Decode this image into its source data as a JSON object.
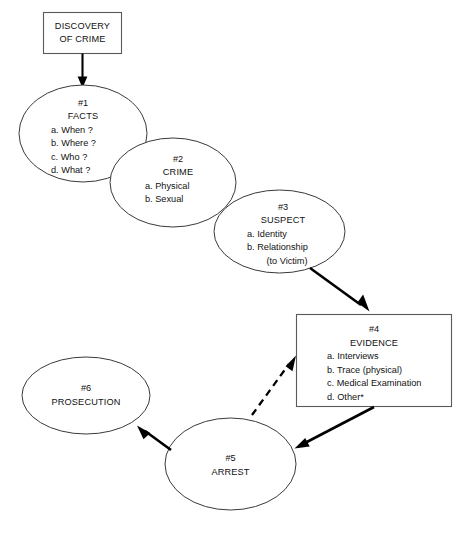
{
  "diagram": {
    "background_color": "#ffffff",
    "line_color": "#3a3a3a",
    "arrow_color": "#000000",
    "text_color": "#111111",
    "start": {
      "id": "discovery-of-crime",
      "shape": "rectangle",
      "line1": "DISCOVERY",
      "line2": "OF CRIME"
    },
    "nodes": [
      {
        "id": "facts",
        "shape": "ellipse",
        "number": "#1",
        "title": "FACTS",
        "items": [
          "a. When ?",
          "b. Where ?",
          "c. Who ?",
          "d. What ?"
        ]
      },
      {
        "id": "crime",
        "shape": "ellipse",
        "number": "#2",
        "title": "CRIME",
        "items": [
          "a. Physical",
          "b. Sexual"
        ]
      },
      {
        "id": "suspect",
        "shape": "ellipse",
        "number": "#3",
        "title": "SUSPECT",
        "items": [
          "a. Identity",
          "b. Relationship",
          "(to Victim)"
        ]
      },
      {
        "id": "evidence",
        "shape": "rectangle",
        "number": "#4",
        "title": "EVIDENCE",
        "items": [
          "a. Interviews",
          "b. Trace (physical)",
          "c. Medical Examination",
          "d. Other*"
        ]
      },
      {
        "id": "arrest",
        "shape": "ellipse",
        "number": "#5",
        "title": "ARREST",
        "items": []
      },
      {
        "id": "prosecution",
        "shape": "ellipse",
        "number": "#6",
        "title": "PROSECUTION",
        "items": []
      }
    ],
    "connectors": [
      {
        "id": "discovery-to-facts",
        "from": "discovery-of-crime",
        "to": "facts",
        "style": "solid"
      },
      {
        "id": "suspect-to-evidence",
        "from": "suspect",
        "to": "evidence",
        "style": "solid"
      },
      {
        "id": "evidence-to-arrest",
        "from": "evidence",
        "to": "arrest",
        "style": "solid"
      },
      {
        "id": "arrest-to-evidence",
        "from": "arrest",
        "to": "evidence",
        "style": "dashed"
      },
      {
        "id": "arrest-to-prosecution",
        "from": "arrest",
        "to": "prosecution",
        "style": "solid"
      }
    ]
  }
}
